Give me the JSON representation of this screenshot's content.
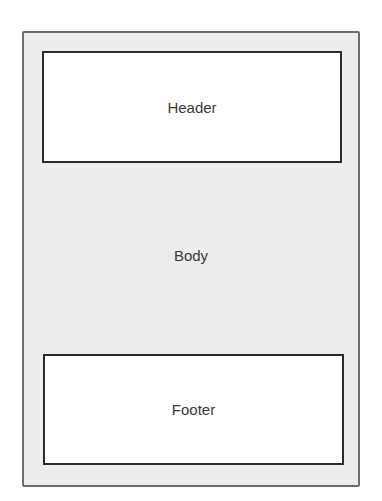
{
  "diagram": {
    "type": "page-layout",
    "regions": {
      "header": {
        "label": "Header"
      },
      "body": {
        "label": "Body"
      },
      "footer": {
        "label": "Footer"
      }
    },
    "colors": {
      "frame_fill": "#ededed",
      "frame_border": "#6e6e6e",
      "box_fill": "#ffffff",
      "box_border": "#2b2b2b",
      "text": "#3a3a3a"
    }
  }
}
